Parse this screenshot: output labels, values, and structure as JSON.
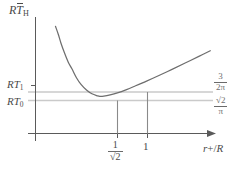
{
  "figure": {
    "kind": "line-plot",
    "background": "#ffffff",
    "axis_color": "#555555",
    "curve_color": "#6a6a6a",
    "guide_color": "#c9c9c9",
    "drop_color": "#8a8a8a",
    "text_color": "#4a4a4a"
  },
  "axes": {
    "y_title": {
      "prefix": "R",
      "symbol": "T",
      "overbar": true,
      "subscript": "H"
    },
    "x_title": {
      "text": "r+/R",
      "var1": "r",
      "plus": "+",
      "slash": "/",
      "var2": "R"
    },
    "y_ticks": [
      {
        "label_prefix": "RT",
        "label_sub": "1",
        "id": "RT1"
      },
      {
        "label_prefix": "RT",
        "label_sub": "0",
        "id": "RT0"
      }
    ],
    "x_ticks": [
      {
        "id": "inv-sqrt-2",
        "numerator": "1",
        "denominator": "√2"
      },
      {
        "id": "one",
        "label": "1"
      }
    ]
  },
  "annotations": [
    {
      "id": "upper-asymptote",
      "numerator": "3",
      "denominator": "2π"
    },
    {
      "id": "lower-asymptote",
      "numerator": "√2",
      "denominator": "π"
    }
  ],
  "chart_data": {
    "type": "line",
    "title": "",
    "xlabel": "r+/R",
    "ylabel": "RT̄H",
    "xlim": [
      0,
      1.95
    ],
    "ylim": [
      0,
      1
    ],
    "grid": false,
    "legend": null,
    "series": [
      {
        "name": "RT_H(r+/R)",
        "comment": "Hawking temperature curve: diverges as r+/R -> 0, minimum at r+/R = 1/sqrt(2), rises linearly for large r+/R",
        "x": [
          0.22,
          0.25,
          0.28,
          0.32,
          0.36,
          0.4,
          0.45,
          0.5,
          0.56,
          0.62,
          0.68,
          0.707,
          0.75,
          0.82,
          0.9,
          1.0,
          1.1,
          1.22,
          1.35,
          1.5,
          1.65,
          1.8,
          1.92
        ],
        "y": [
          0.96,
          0.89,
          0.81,
          0.72,
          0.64,
          0.58,
          0.5,
          0.44,
          0.39,
          0.356,
          0.338,
          0.3333,
          0.335,
          0.346,
          0.364,
          0.394,
          0.428,
          0.47,
          0.518,
          0.575,
          0.634,
          0.694,
          0.742
        ]
      }
    ],
    "reference_lines": [
      {
        "id": "upper-asymptote",
        "orientation": "horizontal",
        "value": 0.3896,
        "label": "3/(2π)",
        "color": "#c9c9c9"
      },
      {
        "id": "lower-asymptote",
        "orientation": "horizontal",
        "value": 0.3333,
        "label": "√2/π",
        "color": "#c9c9c9"
      }
    ],
    "drop_lines": [
      {
        "id": "drop-min",
        "x": 0.707,
        "from_y": 0.3333,
        "to_y": 0.0,
        "label": "1/√2"
      },
      {
        "id": "drop-one",
        "x": 1.0,
        "from_y": 0.394,
        "to_y": 0.0,
        "label": "1"
      }
    ],
    "marked_y_values": [
      {
        "id": "RT1",
        "value": 0.5
      },
      {
        "id": "RT0",
        "value": 0.3333
      }
    ]
  }
}
